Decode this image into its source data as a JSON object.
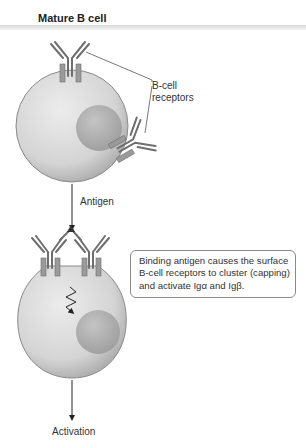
{
  "title": "Mature B cell",
  "labels": {
    "receptors_line1": "B-cell",
    "receptors_line2": "receptors",
    "antigen": "Antigen",
    "activation": "Activation"
  },
  "callout": {
    "line1": "Binding antigen causes the surface",
    "line2": "B-cell receptors to cluster (capping)",
    "line3": "and activate Igα and Igβ."
  },
  "colors": {
    "cell_fill": "#d6d6d6",
    "nucleus_fill": "#b4b4b4",
    "receptor": "#6e6e6e",
    "ig_subunit": "#9a9a9a",
    "line": "#333333"
  }
}
